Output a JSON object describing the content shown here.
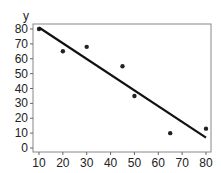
{
  "chart_data": {
    "type": "scatter",
    "title": "",
    "xlabel": "",
    "ylabel": "y",
    "xlim": [
      8,
      82
    ],
    "ylim": [
      -2,
      82
    ],
    "x_ticks": [
      10,
      20,
      30,
      40,
      50,
      60,
      70,
      80
    ],
    "y_ticks": [
      0,
      10,
      20,
      30,
      40,
      50,
      60,
      70,
      80
    ],
    "grid": false,
    "legend": null,
    "series": [
      {
        "name": "data",
        "type": "scatter",
        "x": [
          10,
          20,
          30,
          45,
          50,
          65,
          80
        ],
        "y": [
          80,
          65,
          68,
          55,
          35,
          10,
          13
        ]
      },
      {
        "name": "fit line",
        "type": "line",
        "x": [
          10,
          80
        ],
        "y": [
          81,
          7
        ]
      }
    ]
  }
}
